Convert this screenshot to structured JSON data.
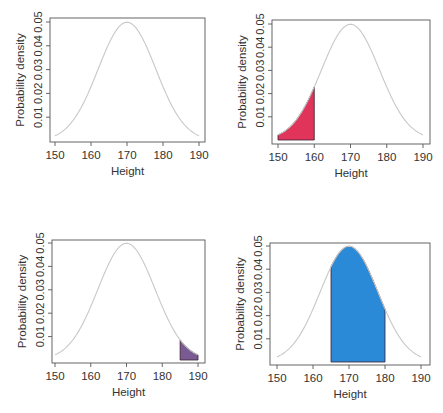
{
  "chart_data": [
    {
      "type": "area",
      "panel": "top-left",
      "title": "",
      "xlabel": "Height",
      "ylabel": "Probability density",
      "xlim": [
        150,
        190
      ],
      "ylim": [
        0,
        0.05
      ],
      "xticks": [
        150,
        160,
        170,
        180,
        190
      ],
      "yticks": [
        0.01,
        0.02,
        0.03,
        0.04,
        0.05
      ],
      "ytick_labels": [
        "0.01",
        "0.02",
        "0.03",
        "0.04",
        "0.05"
      ],
      "distribution": {
        "name": "normal",
        "mean": 170,
        "sd": 8
      },
      "curve_color": "#c8c8c8",
      "shaded": null,
      "grid": false
    },
    {
      "type": "area",
      "panel": "top-right",
      "title": "",
      "xlabel": "Height",
      "ylabel": "Probability density",
      "xlim": [
        150,
        190
      ],
      "ylim": [
        0,
        0.05
      ],
      "xticks": [
        150,
        160,
        170,
        180,
        190
      ],
      "yticks": [
        0.01,
        0.02,
        0.03,
        0.04,
        0.05
      ],
      "ytick_labels": [
        "0.01",
        "0.02",
        "0.03",
        "0.04",
        "0.05"
      ],
      "distribution": {
        "name": "normal",
        "mean": 170,
        "sd": 8
      },
      "curve_color": "#c8c8c8",
      "shaded": {
        "from": 150,
        "to": 160,
        "color": "#e0345a"
      },
      "grid": false
    },
    {
      "type": "area",
      "panel": "bottom-left",
      "title": "",
      "xlabel": "Height",
      "ylabel": "Probability density",
      "xlim": [
        150,
        190
      ],
      "ylim": [
        0,
        0.05
      ],
      "xticks": [
        150,
        160,
        170,
        180,
        190
      ],
      "yticks": [
        0.01,
        0.02,
        0.03,
        0.04,
        0.05
      ],
      "ytick_labels": [
        "0.01",
        "0.02",
        "0.03",
        "0.04",
        "0.05"
      ],
      "distribution": {
        "name": "normal",
        "mean": 170,
        "sd": 8
      },
      "curve_color": "#c8c8c8",
      "shaded": {
        "from": 185,
        "to": 190,
        "color": "#7a5a92"
      },
      "grid": false
    },
    {
      "type": "area",
      "panel": "bottom-right",
      "title": "",
      "xlabel": "Height",
      "ylabel": "Probability density",
      "xlim": [
        150,
        190
      ],
      "ylim": [
        0,
        0.05
      ],
      "xticks": [
        150,
        160,
        170,
        180,
        190
      ],
      "yticks": [
        0.01,
        0.02,
        0.03,
        0.04,
        0.05
      ],
      "ytick_labels": [
        "0.01",
        "0.02",
        "0.03",
        "0.04",
        "0.05"
      ],
      "distribution": {
        "name": "normal",
        "mean": 170,
        "sd": 8
      },
      "curve_color": "#c8c8c8",
      "shaded": {
        "from": 165,
        "to": 180,
        "color": "#2a8ad8"
      },
      "grid": false
    }
  ],
  "layout": {
    "panels": [
      {
        "frame": [
          50,
          18,
          205,
          142
        ],
        "xpix": [
          55,
          199
        ],
        "ypix_zero": 141,
        "ypix_005": 22
      },
      {
        "frame": [
          272,
          20,
          430,
          144
        ],
        "xpix": [
          278,
          423
        ],
        "ypix_zero": 140,
        "ypix_005": 24
      },
      {
        "frame": [
          52,
          240,
          205,
          363
        ],
        "xpix": [
          55,
          198
        ],
        "ypix_zero": 360,
        "ypix_005": 243
      },
      {
        "frame": [
          270,
          243,
          430,
          365
        ],
        "xpix": [
          277,
          421
        ],
        "ypix_zero": 362,
        "ypix_005": 246
      }
    ]
  }
}
